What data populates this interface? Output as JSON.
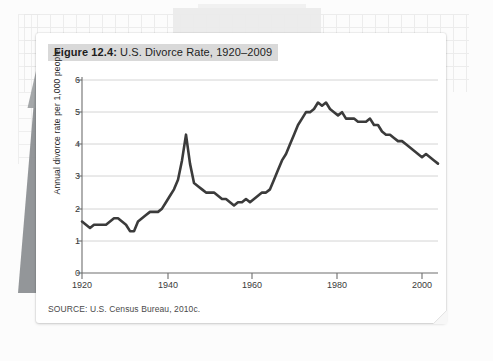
{
  "figure": {
    "label": "Figure 12.4:",
    "caption": " U.S. Divorce Rate, 1920–2009",
    "source": "SOURCE: U.S. Census Bureau, 2010c."
  },
  "chart_data": {
    "type": "line",
    "title": "Figure 12.4: U.S. Divorce Rate, 1920–2009",
    "xlabel": "",
    "ylabel": "Annual divorce rate per 1,000 people",
    "xlim": [
      1920,
      2009
    ],
    "ylim": [
      0,
      6
    ],
    "grid": "horizontal",
    "legend": "none",
    "line_color": "#3b3b3b",
    "xticks": [
      1920,
      1940,
      1960,
      1980,
      2000
    ],
    "xtick_labels": [
      "1920",
      "1940",
      "1960",
      "1980",
      "2000"
    ],
    "yticks": [
      0,
      1,
      2,
      3,
      4,
      5,
      6
    ],
    "ytick_labels": [
      "0",
      "1",
      "2",
      "3",
      "4",
      "5",
      "6"
    ],
    "series": [
      {
        "name": "Annual divorce rate per 1,000 people",
        "x": [
          1920,
          1921,
          1922,
          1923,
          1924,
          1925,
          1926,
          1927,
          1928,
          1929,
          1930,
          1931,
          1932,
          1933,
          1934,
          1935,
          1936,
          1937,
          1938,
          1939,
          1940,
          1941,
          1942,
          1943,
          1944,
          1945,
          1946,
          1947,
          1948,
          1949,
          1950,
          1951,
          1952,
          1953,
          1954,
          1955,
          1956,
          1957,
          1958,
          1959,
          1960,
          1961,
          1962,
          1963,
          1964,
          1965,
          1966,
          1967,
          1968,
          1969,
          1970,
          1971,
          1972,
          1973,
          1974,
          1975,
          1976,
          1977,
          1978,
          1979,
          1980,
          1981,
          1982,
          1983,
          1984,
          1985,
          1986,
          1987,
          1988,
          1989,
          1990,
          1991,
          1992,
          1993,
          1994,
          1995,
          1996,
          1997,
          1998,
          1999,
          2000,
          2001,
          2002,
          2003,
          2004,
          2005,
          2006,
          2007,
          2008,
          2009
        ],
        "y": [
          1.6,
          1.5,
          1.4,
          1.5,
          1.5,
          1.5,
          1.5,
          1.6,
          1.7,
          1.7,
          1.6,
          1.5,
          1.3,
          1.3,
          1.6,
          1.7,
          1.8,
          1.9,
          1.9,
          1.9,
          2.0,
          2.2,
          2.4,
          2.6,
          2.9,
          3.5,
          4.3,
          3.4,
          2.8,
          2.7,
          2.6,
          2.5,
          2.5,
          2.5,
          2.4,
          2.3,
          2.3,
          2.2,
          2.1,
          2.2,
          2.2,
          2.3,
          2.2,
          2.3,
          2.4,
          2.5,
          2.5,
          2.6,
          2.9,
          3.2,
          3.5,
          3.7,
          4.0,
          4.3,
          4.6,
          4.8,
          5.0,
          5.0,
          5.1,
          5.3,
          5.2,
          5.3,
          5.1,
          5.0,
          4.9,
          5.0,
          4.8,
          4.8,
          4.8,
          4.7,
          4.7,
          4.7,
          4.8,
          4.6,
          4.6,
          4.4,
          4.3,
          4.3,
          4.2,
          4.1,
          4.1,
          4.0,
          3.9,
          3.8,
          3.7,
          3.6,
          3.7,
          3.6,
          3.5,
          3.4
        ]
      }
    ]
  },
  "axis": {
    "y_title": "Annual divorce rate per 1,000 people"
  }
}
